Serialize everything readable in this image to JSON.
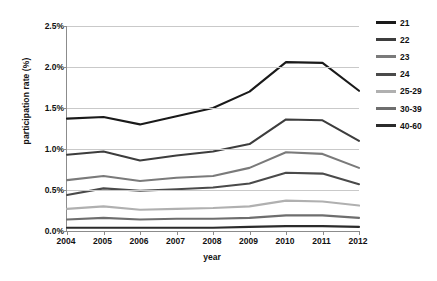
{
  "chart_data": {
    "type": "line",
    "title": "",
    "xlabel": "year",
    "ylabel": "participation rate (%)",
    "x": [
      2004,
      2005,
      2006,
      2007,
      2008,
      2009,
      2010,
      2011,
      2012
    ],
    "xtick_labels": [
      "2004",
      "2005",
      "2006",
      "2007",
      "2008",
      "2009",
      "2010",
      "2011",
      "2012"
    ],
    "ytick_labels": [
      "0.0%",
      "0.5%",
      "1.0%",
      "1.5%",
      "2.0%",
      "2.5%"
    ],
    "ytick_values": [
      0.0,
      0.5,
      1.0,
      1.5,
      2.0,
      2.5
    ],
    "ylim": [
      0.0,
      2.5
    ],
    "grid": true,
    "legend_position": "right",
    "units": "%",
    "series": [
      {
        "name": "21",
        "color": "#1a1a1a",
        "values": [
          1.37,
          1.39,
          1.3,
          1.4,
          1.5,
          1.7,
          2.06,
          2.05,
          1.71
        ]
      },
      {
        "name": "22",
        "color": "#3d3d3d",
        "values": [
          0.93,
          0.97,
          0.86,
          0.92,
          0.97,
          1.06,
          1.36,
          1.35,
          1.1
        ]
      },
      {
        "name": "23",
        "color": "#7a7a7a",
        "values": [
          0.62,
          0.67,
          0.61,
          0.65,
          0.67,
          0.77,
          0.96,
          0.94,
          0.77
        ]
      },
      {
        "name": "24",
        "color": "#4a4a4a",
        "values": [
          0.44,
          0.52,
          0.49,
          0.51,
          0.53,
          0.58,
          0.71,
          0.7,
          0.57
        ]
      },
      {
        "name": "25-29",
        "color": "#b0b0b0",
        "values": [
          0.27,
          0.3,
          0.26,
          0.27,
          0.28,
          0.3,
          0.37,
          0.36,
          0.31
        ]
      },
      {
        "name": "30-39",
        "color": "#6e6e6e",
        "values": [
          0.14,
          0.16,
          0.14,
          0.15,
          0.15,
          0.16,
          0.19,
          0.19,
          0.16
        ]
      },
      {
        "name": "40-60",
        "color": "#2b2b2b",
        "values": [
          0.04,
          0.04,
          0.04,
          0.04,
          0.04,
          0.05,
          0.06,
          0.06,
          0.05
        ]
      }
    ]
  },
  "caption": ""
}
